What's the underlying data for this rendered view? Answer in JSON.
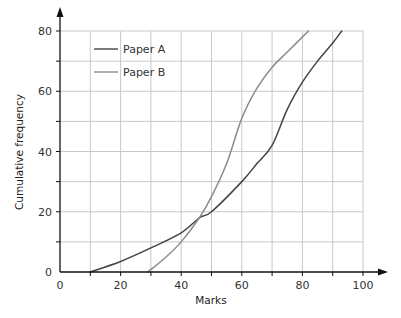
{
  "chart_data": {
    "type": "line",
    "title": "",
    "xlabel": "Marks",
    "ylabel": "Cumulative frequency",
    "xlim": [
      0,
      100
    ],
    "ylim": [
      0,
      80
    ],
    "x_ticks": [
      0,
      20,
      40,
      60,
      80,
      100
    ],
    "y_ticks": [
      0,
      20,
      40,
      60,
      80
    ],
    "x_minor_step": 10,
    "y_minor_step": 10,
    "grid": true,
    "legend_position": "upper-left",
    "series": [
      {
        "name": "Paper A",
        "color": "#444444",
        "x": [
          10,
          20,
          30,
          40,
          46,
          50,
          60,
          65,
          70,
          75,
          80,
          85,
          90,
          93
        ],
        "y": [
          0,
          3.5,
          8,
          13,
          18,
          20,
          30,
          36,
          42,
          54,
          63,
          70,
          76,
          80
        ]
      },
      {
        "name": "Paper B",
        "color": "#8c8c8c",
        "x": [
          29,
          35,
          40,
          46,
          50,
          55,
          60,
          65,
          70,
          75,
          82
        ],
        "y": [
          0,
          5,
          10,
          18,
          25,
          36,
          51,
          61,
          68,
          73,
          80
        ]
      }
    ]
  }
}
